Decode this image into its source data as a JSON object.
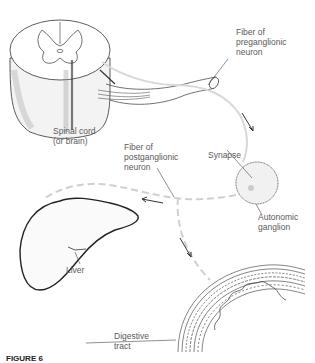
{
  "diagram": {
    "type": "anatomical-illustration",
    "labels": {
      "spinal_cord": "Spinal cord\n(or brain)",
      "preganglionic_fiber": "Fiber of\npreganglionic\nneuron",
      "synapse": "Synapse",
      "postganglionic_fiber": "Fiber of\npostganglionic\nneuron",
      "autonomic_ganglion": "Autonomic\nganglion",
      "liver": "Liver",
      "digestive_tract": "Digestive\ntract"
    },
    "caption": {
      "prefix": "FIGURE 6",
      "text": "Connections to the autonomic ganglion and effector organs (truncated)"
    },
    "structures": [
      "spinal-cord-cross-section",
      "nerve-root",
      "preganglionic-fiber",
      "autonomic-ganglion",
      "postganglionic-fiber",
      "liver",
      "digestive-tract-wall"
    ],
    "colors": {
      "line": "#333333",
      "fiber": "#d8d8d8",
      "text": "#5a5a5a"
    }
  }
}
